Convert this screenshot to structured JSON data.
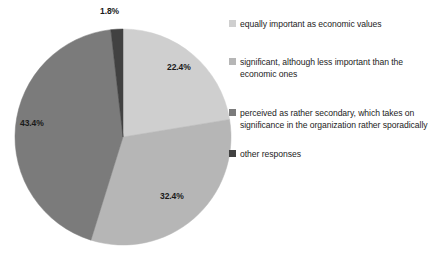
{
  "chart_data": {
    "type": "pie",
    "title": "",
    "subtitle": "",
    "xlabel": "",
    "ylabel": "",
    "grid": false,
    "legend_position": "right",
    "start_angle_deg": 0,
    "direction": "clockwise",
    "units": "percent",
    "total": 100.0,
    "categories": [
      "equally important as economic values",
      "significant, although less important than the economic ones",
      "perceived as rather secondary, which takes on significance in the organization rather sporadically",
      "other responses"
    ],
    "values": [
      22.4,
      32.4,
      43.4,
      1.8
    ],
    "data_labels": [
      "22.4%",
      "32.4%",
      "43.4%",
      "1.8%"
    ],
    "colors": [
      "#cfcfcf",
      "#b6b6b6",
      "#7b7b7b",
      "#414141"
    ],
    "slices": [
      {
        "label": "equally important as economic values",
        "value": 22.4,
        "data_label": "22.4%",
        "color": "#cfcfcf",
        "label_x": 167,
        "label_y": 62,
        "label_outside": false
      },
      {
        "label": "significant, although less important than the economic ones",
        "value": 32.4,
        "data_label": "32.4%",
        "color": "#b6b6b6",
        "label_x": 160,
        "label_y": 191,
        "label_outside": false
      },
      {
        "label": "perceived as rather secondary, which takes on significance in the organization rather sporadically",
        "value": 43.4,
        "data_label": "43.4%",
        "color": "#7b7b7b",
        "label_x": 20,
        "label_y": 118,
        "label_outside": false
      },
      {
        "label": "other responses",
        "value": 1.8,
        "data_label": "1.8%",
        "color": "#414141",
        "label_x": 100,
        "label_y": 6,
        "label_outside": true
      }
    ],
    "geometry": {
      "center_x": 123,
      "center_y": 137,
      "radius": 108
    }
  },
  "legend": {
    "items": [
      {
        "label": "equally important as economic values",
        "color": "#cfcfcf",
        "icon": "legend-swatch-icon"
      },
      {
        "label": "significant, although less important than the economic ones",
        "color": "#b6b6b6",
        "icon": "legend-swatch-icon"
      },
      {
        "label": "perceived as rather secondary, which takes on significance in the organization rather sporadically",
        "color": "#7b7b7b",
        "icon": "legend-swatch-icon"
      },
      {
        "label": "other responses",
        "color": "#414141",
        "icon": "legend-swatch-icon"
      }
    ]
  }
}
